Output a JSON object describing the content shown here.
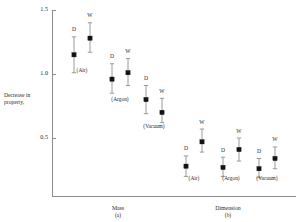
{
  "chart_data": {
    "type": "scatter",
    "title": "",
    "ylabel": "Decrease in property,",
    "ylabel_lines": [
      "Decrease in",
      "property,"
    ],
    "xlabel": "",
    "ylim": [
      0.0,
      1.5
    ],
    "yticks": [
      1.5,
      1.0,
      0.5
    ],
    "ytick_labels": [
      "1.5",
      "1.0",
      "0.5"
    ],
    "grid": false,
    "legend": "none",
    "error_bars": true,
    "marker_style": "filled-square",
    "sections": [
      {
        "name": "Mass",
        "caption": "(a)",
        "groups": [
          {
            "label": "(Air)",
            "points": [
              {
                "series": "D",
                "value": 1.15,
                "low": 1.01,
                "high": 1.29
              },
              {
                "series": "W",
                "value": 1.28,
                "low": 1.17,
                "high": 1.4
              }
            ]
          },
          {
            "label": "(Argon)",
            "points": [
              {
                "series": "D",
                "value": 0.96,
                "low": 0.85,
                "high": 1.08
              },
              {
                "series": "W",
                "value": 1.01,
                "low": 0.91,
                "high": 1.12
              }
            ]
          },
          {
            "label": "(Vacuum)",
            "points": [
              {
                "series": "D",
                "value": 0.8,
                "low": 0.69,
                "high": 0.91
              },
              {
                "series": "W",
                "value": 0.7,
                "low": 0.62,
                "high": 0.81
              }
            ]
          }
        ]
      },
      {
        "name": "Dimension",
        "caption": "(b)",
        "groups": [
          {
            "label": "(Air)",
            "points": [
              {
                "series": "D",
                "value": 0.28,
                "low": 0.2,
                "high": 0.36
              },
              {
                "series": "W",
                "value": 0.47,
                "low": 0.39,
                "high": 0.57
              }
            ]
          },
          {
            "label": "(Argon)",
            "points": [
              {
                "series": "D",
                "value": 0.27,
                "low": 0.2,
                "high": 0.35
              },
              {
                "series": "W",
                "value": 0.41,
                "low": 0.32,
                "high": 0.5
              }
            ]
          },
          {
            "label": "(Vacuum)",
            "points": [
              {
                "series": "D",
                "value": 0.26,
                "low": 0.19,
                "high": 0.34
              },
              {
                "series": "W",
                "value": 0.34,
                "low": 0.26,
                "high": 0.43
              }
            ]
          }
        ]
      }
    ],
    "series_names": [
      "D",
      "W"
    ]
  },
  "geometry": {
    "axis_x": 52,
    "axis_top": 10,
    "axis_bottom": 196,
    "axis_right": 296,
    "y_top_value": 1.5,
    "y_top_px": 10,
    "y_bottom_value": 0.0,
    "y_bottom_px": 202,
    "group_x": [
      {
        "d": 74,
        "w": 90
      },
      {
        "d": 112,
        "w": 128
      },
      {
        "d": 146,
        "w": 162
      },
      {
        "d": 186,
        "w": 202
      },
      {
        "d": 223,
        "w": 239
      },
      {
        "d": 259,
        "w": 275
      }
    ],
    "group_label_y": [
      68,
      97,
      124,
      176,
      176,
      176
    ],
    "section_title_x": [
      118,
      228
    ],
    "section_title_y": 205,
    "section_caption_y": 213
  }
}
